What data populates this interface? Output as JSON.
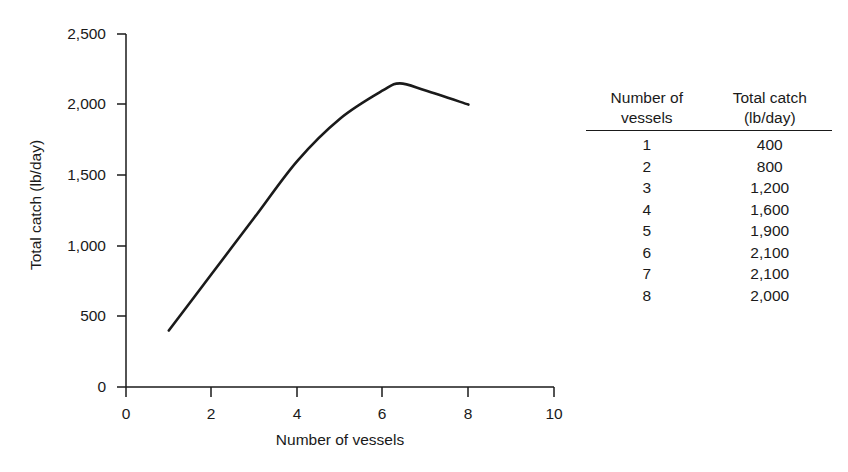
{
  "chart_data": {
    "type": "line",
    "title": "",
    "xlabel": "Number of vessels",
    "ylabel": "Total catch (lb/day)",
    "xlim": [
      0,
      10
    ],
    "ylim": [
      0,
      2500
    ],
    "xticks": [
      "0",
      "2",
      "4",
      "6",
      "8",
      "10"
    ],
    "xtick_values": [
      0,
      2,
      4,
      6,
      8,
      10
    ],
    "yticks": [
      "0",
      "500",
      "1,000",
      "1,500",
      "2,000",
      "2,500"
    ],
    "ytick_values": [
      0,
      500,
      1000,
      1500,
      2000,
      2500
    ],
    "grid": false,
    "legend": "none",
    "line_color": "#1a1a1a",
    "x": [
      1,
      2,
      3,
      4,
      5,
      6,
      7,
      8
    ],
    "values": [
      400,
      800,
      1200,
      1600,
      1900,
      2100,
      2100,
      2000
    ],
    "curve_note": "smooth curve through points, peak near x=6.4 at about 2,150",
    "peak": {
      "x": 6.4,
      "y": 2150
    }
  },
  "table": {
    "headers": {
      "col1_line1": "Number of",
      "col1_line2": "vessels",
      "col2_line1": "Total catch",
      "col2_line2": "(lb/day)"
    },
    "rows": [
      {
        "vessels": "1",
        "catch": "400"
      },
      {
        "vessels": "2",
        "catch": "800"
      },
      {
        "vessels": "3",
        "catch": "1,200"
      },
      {
        "vessels": "4",
        "catch": "1,600"
      },
      {
        "vessels": "5",
        "catch": "1,900"
      },
      {
        "vessels": "6",
        "catch": "2,100"
      },
      {
        "vessels": "7",
        "catch": "2,100"
      },
      {
        "vessels": "8",
        "catch": "2,000"
      }
    ]
  },
  "axis_titles": {
    "x": "Number of vessels",
    "y": "Total catch (lb/day)"
  }
}
